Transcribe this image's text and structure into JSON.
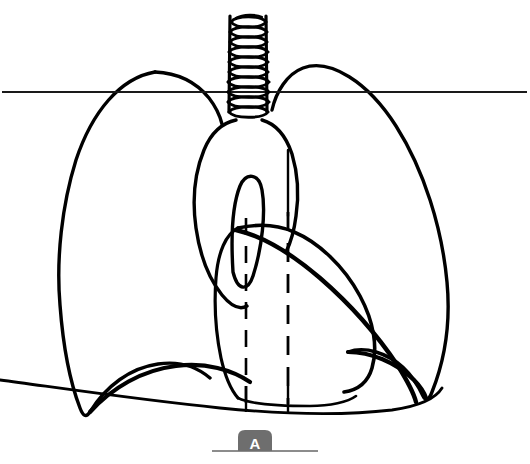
{
  "figure": {
    "panel_label": "A",
    "background_color": "#ffffff",
    "stroke_color": "#000000",
    "label_badge_color": "#6e6e6e",
    "label_text_color": "#ffffff",
    "baseline_color": "#8c8c8c",
    "clavicle_line_color": "#1a1a1a"
  },
  "structures": [
    {
      "name": "trachea",
      "label": "Trachea with cartilage rings",
      "ring_count": 10,
      "top_y": 14,
      "bottom_y": 112,
      "center_x": 248,
      "half_width": 19
    },
    {
      "name": "left-lung-field",
      "label": "Left lung field outline"
    },
    {
      "name": "right-lung-field",
      "label": "Right lung field outline"
    },
    {
      "name": "aortic-arch",
      "label": "Aortic arch / mediastinal contour"
    },
    {
      "name": "aortic-inner-loop",
      "label": "Inner aortic loop"
    },
    {
      "name": "cardiac-silhouette",
      "label": "Cardiac silhouette"
    },
    {
      "name": "left-hemidiaphragm",
      "label": "Left hemidiaphragm"
    },
    {
      "name": "right-hemidiaphragm",
      "label": "Right hemidiaphragm"
    },
    {
      "name": "spine-border-left",
      "label": "Left vertebral border (dashed)",
      "x": 246,
      "dashed": true
    },
    {
      "name": "spine-border-right",
      "label": "Right vertebral border (dashed)",
      "x": 288,
      "dashed": true
    },
    {
      "name": "clavicle-reference-line",
      "label": "Horizontal reference line",
      "y": 92,
      "x_start": 2,
      "x_end": 527
    },
    {
      "name": "baseline",
      "label": "Bottom baseline",
      "y": 451,
      "x_start": 212,
      "x_end": 318
    }
  ]
}
